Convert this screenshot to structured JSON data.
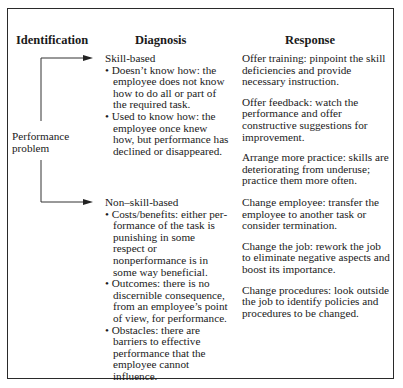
{
  "headers": {
    "identification": "Identification",
    "diagnosis": "Diagnosis",
    "response": "Response"
  },
  "identification_label": [
    "Performance",
    "problem"
  ],
  "diagnosis": {
    "skill_based": {
      "title": "Skill-based",
      "bullets": [
        "• Doesn’t know how: the employee does not know how to do all or part of the required task.",
        "• Used to know how: the employee once knew how, but performance has declined  or disappeared."
      ]
    },
    "non_skill_based": {
      "title": "Non–skill-based",
      "bullets": [
        "• Costs/benefits: either per­formance of the task is pun­ishing in some respect or nonperformance is in some way beneficial.",
        "• Outcomes: there is no dis­cernible consequence, from an employee’s point of view, for performance.",
        "• Obstacles: there are barriers to effective performance that the employee cannot influence."
      ]
    }
  },
  "responses": {
    "skill_based": [
      "Offer training: pinpoint the skill deficiencies and provide necessary instruction.",
      "Offer feedback: watch the perfor­mance and offer constructive sug­gestions for improvement.",
      "Arrange more practice: skills are deteriorating from underuse; practice them more often."
    ],
    "non_skill_based": [
      "Change employee: transfer the employee to another task or consider termination.",
      "Change the job: rework the job to eliminate negative aspects and boost its importance.",
      "Change procedures: look outside the job to identify policies and procedures to be changed."
    ]
  }
}
